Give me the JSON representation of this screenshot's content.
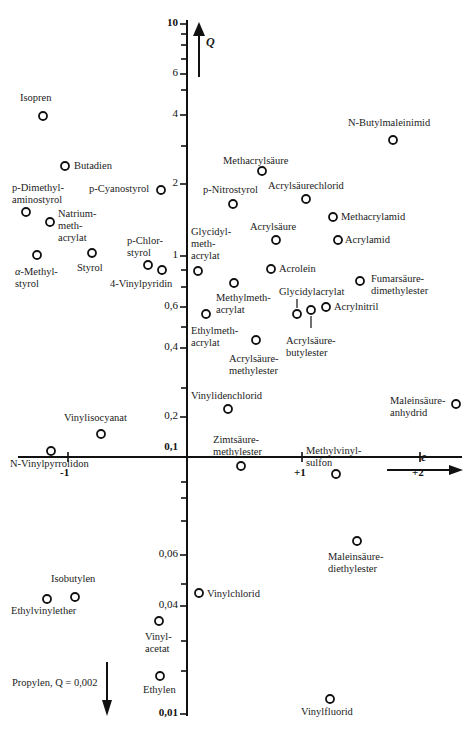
{
  "chart_data": {
    "type": "scatter",
    "title": "",
    "xlabel": "e",
    "ylabel": "Q",
    "x_scale": "linear",
    "y_scale": "log",
    "xlim": [
      -1.45,
      2.35
    ],
    "ylim": [
      0.01,
      10
    ],
    "grid": false,
    "x_ticks": [
      "-1",
      "+1",
      "+2"
    ],
    "y_ticks": [
      "10",
      "6",
      "4",
      "2",
      "1",
      "0,6",
      "0,4",
      "0,2",
      "0,1",
      "0,06",
      "0,04",
      "0,01"
    ],
    "annotation": "Propylen, Q = 0,002",
    "points": [
      {
        "name": "Isopren",
        "e": -1.22,
        "Q": 3.3,
        "px": 43,
        "py": 116
      },
      {
        "name": "Butadien",
        "e": -1.05,
        "Q": 2.4,
        "px": 65,
        "py": 166
      },
      {
        "name": "p-Dimethylaminostyrol",
        "e": -1.37,
        "Q": 1.5,
        "px": 26,
        "py": 212
      },
      {
        "name": "Natrium-methacrylat",
        "e": -1.15,
        "Q": 1.36,
        "px": 50,
        "py": 222
      },
      {
        "name": "α-Methylstyrol",
        "e": -1.27,
        "Q": 0.98,
        "px": 37,
        "py": 255
      },
      {
        "name": "Styrol",
        "e": -0.8,
        "Q": 1.0,
        "px": 92,
        "py": 253
      },
      {
        "name": "p-Cyanostyrol",
        "e": -0.21,
        "Q": 1.86,
        "px": 161,
        "py": 190
      },
      {
        "name": "p-Chlorstyrol",
        "e": -0.33,
        "Q": 0.87,
        "px": 148,
        "py": 265
      },
      {
        "name": "4-Vinylpyridin",
        "e": -0.2,
        "Q": 0.82,
        "px": 162,
        "py": 270
      },
      {
        "name": "Methacrylsäure",
        "e": 0.65,
        "Q": 2.34,
        "px": 262,
        "py": 171
      },
      {
        "name": "p-Nitrostyrol",
        "e": 0.39,
        "Q": 1.63,
        "px": 233,
        "py": 204
      },
      {
        "name": "Acrylsäurechlorid",
        "e": 1.06,
        "Q": 1.7,
        "px": 306,
        "py": 199
      },
      {
        "name": "N-Butylmaleinimid",
        "e": 1.76,
        "Q": 3.2,
        "px": 393,
        "py": 140
      },
      {
        "name": "Methacrylamid",
        "e": 1.33,
        "Q": 1.46,
        "px": 333,
        "py": 217
      },
      {
        "name": "Acrylsäure",
        "e": 0.77,
        "Q": 1.15,
        "px": 276,
        "py": 240
      },
      {
        "name": "Acrylamid",
        "e": 1.3,
        "Q": 1.12,
        "px": 338,
        "py": 240
      },
      {
        "name": "Glycidylmethacrylat",
        "e": 0.1,
        "Q": 0.85,
        "px": 198,
        "py": 271
      },
      {
        "name": "Acrolein",
        "e": 0.73,
        "Q": 0.86,
        "px": 271,
        "py": 269
      },
      {
        "name": "Methylmethacrylat",
        "e": 0.4,
        "Q": 0.74,
        "px": 234,
        "py": 283
      },
      {
        "name": "Fumarsäuredimethylester",
        "e": 1.49,
        "Q": 0.76,
        "px": 360,
        "py": 281
      },
      {
        "name": "Ethylmethacrylat",
        "e": 0.17,
        "Q": 0.6,
        "px": 206,
        "py": 314
      },
      {
        "name": "Glycidylacrylat",
        "e": 0.99,
        "Q": 0.55,
        "px": 297,
        "py": 314
      },
      {
        "name": "Acrylsäurebutylester",
        "e": 1.06,
        "Q": 0.58,
        "px": 311,
        "py": 310
      },
      {
        "name": "Acrylnitril",
        "e": 1.2,
        "Q": 0.6,
        "px": 326,
        "py": 307
      },
      {
        "name": "Acrylsäuremethylester",
        "e": 0.6,
        "Q": 0.42,
        "px": 256,
        "py": 340
      },
      {
        "name": "Vinylidenchlorid",
        "e": 0.36,
        "Q": 0.22,
        "px": 228,
        "py": 409
      },
      {
        "name": "Maleinsäureanhydrid",
        "e": 2.25,
        "Q": 0.23,
        "px": 456,
        "py": 404
      },
      {
        "name": "Zimtsäuremethylester",
        "e": 0.45,
        "Q": 0.12,
        "px": 241,
        "py": 466
      },
      {
        "name": "Methylvinylsulfon",
        "e": 1.28,
        "Q": 0.11,
        "px": 336,
        "py": 474
      },
      {
        "name": "Vinylisocyanat",
        "e": -0.7,
        "Q": 0.17,
        "px": 101,
        "py": 434
      },
      {
        "name": "N-Vinylpyrrolidon",
        "e": -1.13,
        "Q": 0.14,
        "px": 51,
        "py": 451
      },
      {
        "name": "Maleinsäurediethylester",
        "e": 1.47,
        "Q": 0.065,
        "px": 357,
        "py": 541
      },
      {
        "name": "Vinylchlorid",
        "e": 0.16,
        "Q": 0.044,
        "px": 199,
        "py": 593
      },
      {
        "name": "Isobutylen",
        "e": -0.96,
        "Q": 0.044,
        "px": 75,
        "py": 597
      },
      {
        "name": "Ethylvinylether",
        "e": -1.17,
        "Q": 0.043,
        "px": 47,
        "py": 599
      },
      {
        "name": "Vinylacetat",
        "e": -0.22,
        "Q": 0.035,
        "px": 159,
        "py": 621
      },
      {
        "name": "Ethylen",
        "e": -0.2,
        "Q": 0.022,
        "px": 160,
        "py": 676
      },
      {
        "name": "Vinylfluorid",
        "e": 1.28,
        "Q": 0.012,
        "px": 330,
        "py": 699
      }
    ],
    "labels": [
      {
        "text": "Isopren",
        "x": 20,
        "y": 92
      },
      {
        "text": "Butadien",
        "x": 74,
        "y": 160
      },
      {
        "text": "p-Dimethyl-\naminostyrol",
        "x": 12,
        "y": 182
      },
      {
        "text": "Natrium-\nmeth-\nacrylat",
        "x": 58,
        "y": 208
      },
      {
        "text": "α-Methyl-\nstyrol",
        "x": 15,
        "y": 266,
        "italic_first": true
      },
      {
        "text": "Styrol",
        "x": 77,
        "y": 262
      },
      {
        "text": "p-Cyanostyrol",
        "x": 89,
        "y": 183
      },
      {
        "text": "p-Chlor-\nstyrol",
        "x": 127,
        "y": 235
      },
      {
        "text": "4-Vinylpyridin",
        "x": 110,
        "y": 278
      },
      {
        "text": "Methacrylsäure",
        "x": 223,
        "y": 155
      },
      {
        "text": "p-Nitrostyrol",
        "x": 203,
        "y": 184
      },
      {
        "text": "Acrylsäurechlorid",
        "x": 268,
        "y": 180
      },
      {
        "text": "N-Butylmaleinimid",
        "x": 348,
        "y": 117
      },
      {
        "text": "Methacrylamid",
        "x": 341,
        "y": 211
      },
      {
        "text": "Acrylsäure",
        "x": 250,
        "y": 221
      },
      {
        "text": "Acrylamid",
        "x": 345,
        "y": 234
      },
      {
        "text": "Glycidyl-\nmeth-\nacrylat",
        "x": 191,
        "y": 226
      },
      {
        "text": "Acrolein",
        "x": 279,
        "y": 263
      },
      {
        "text": "Methylmeth-\nacrylat",
        "x": 216,
        "y": 292
      },
      {
        "text": "Fumarsäure-\ndimethylester",
        "x": 371,
        "y": 273
      },
      {
        "text": "Glycidylacrylat",
        "x": 279,
        "y": 286
      },
      {
        "text": "Acrylnitril",
        "x": 334,
        "y": 301
      },
      {
        "text": "Ethylmeth-\nacrylat",
        "x": 191,
        "y": 325
      },
      {
        "text": "Acrylsäure-\nbutylester",
        "x": 286,
        "y": 335
      },
      {
        "text": "Acrylsäure-\nmethylester",
        "x": 229,
        "y": 353
      },
      {
        "text": "Vinylidenchlorid",
        "x": 191,
        "y": 390
      },
      {
        "text": "Maleinsäure-\nanhydrid",
        "x": 390,
        "y": 395
      },
      {
        "text": "Zimtsäure-\nmethylester",
        "x": 213,
        "y": 434
      },
      {
        "text": "Methylvinyl-\nsulfon",
        "x": 306,
        "y": 445
      },
      {
        "text": "Vinylisocyanat",
        "x": 64,
        "y": 412
      },
      {
        "text": "N-Vinylpyrrolidon",
        "x": 10,
        "y": 458
      },
      {
        "text": "Maleinsäure-\ndiethylester",
        "x": 328,
        "y": 551
      },
      {
        "text": "Vinylchlorid",
        "x": 207,
        "y": 588
      },
      {
        "text": "Isobutylen",
        "x": 51,
        "y": 573
      },
      {
        "text": "Ethylvinylether",
        "x": 11,
        "y": 605
      },
      {
        "text": "Vinyl-\nacetat",
        "x": 145,
        "y": 631
      },
      {
        "text": "Ethylen",
        "x": 143,
        "y": 684
      },
      {
        "text": "Vinylfluorid",
        "x": 301,
        "y": 706
      }
    ]
  },
  "axes": {
    "y_axis_name": "Q",
    "x_axis_name": "e",
    "propylen_note": "Propylen, Q = 0,002"
  },
  "ticks": {
    "y": [
      {
        "label": "10",
        "py": 24,
        "bold": true
      },
      {
        "label": "6",
        "py": 74
      },
      {
        "label": "4",
        "py": 115
      },
      {
        "label": "2",
        "py": 184
      },
      {
        "label": "1",
        "py": 256
      },
      {
        "label": "0,6",
        "py": 307
      },
      {
        "label": "0,4",
        "py": 348
      },
      {
        "label": "0,2",
        "py": 417
      },
      {
        "label": "0,1",
        "py": 457,
        "bold": true
      },
      {
        "label": "0,06",
        "py": 555
      },
      {
        "label": "0,04",
        "py": 606
      },
      {
        "label": "0,01",
        "py": 714,
        "bold": true
      }
    ],
    "x": [
      {
        "label": "-1",
        "px": 68
      },
      {
        "label": "+1",
        "px": 302
      },
      {
        "label": "+2",
        "px": 420
      }
    ]
  },
  "colors": {
    "ink": "#111111",
    "marker_fill": "#ffffff",
    "background": "#ffffff"
  }
}
